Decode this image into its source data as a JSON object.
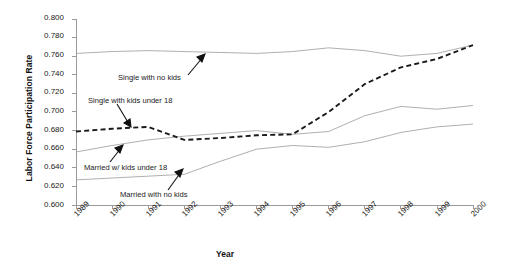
{
  "chart_data": {
    "type": "line",
    "title": "",
    "xlabel": "Year",
    "ylabel": "Labor Force Participation Rate",
    "x": [
      1989,
      1990,
      1991,
      1992,
      1993,
      1994,
      1995,
      1996,
      1997,
      1998,
      1999,
      2000
    ],
    "xticklabels": [
      "1989",
      "1990",
      "1991",
      "1992",
      "1993",
      "1994",
      "1995",
      "1996",
      "1997",
      "1998",
      "1999",
      "2000"
    ],
    "yticklabels": [
      "0.600",
      "0.620",
      "0.640",
      "0.660",
      "0.680",
      "0.700",
      "0.720",
      "0.740",
      "0.760",
      "0.780",
      "0.800"
    ],
    "ylim": [
      0.6,
      0.8
    ],
    "ytick_step": 0.02,
    "grid": false,
    "legend_position": "inline-annotations",
    "series": [
      {
        "name": "Single with no kids",
        "style": "solid",
        "color": "#9a9a9a",
        "values": [
          0.763,
          0.765,
          0.766,
          0.765,
          0.764,
          0.763,
          0.765,
          0.769,
          0.766,
          0.76,
          0.763,
          0.772
        ]
      },
      {
        "name": "Single with kids under 18",
        "style": "dashed",
        "color": "#1a1a1a",
        "values": [
          0.679,
          0.682,
          0.684,
          0.67,
          0.672,
          0.675,
          0.676,
          0.7,
          0.73,
          0.748,
          0.757,
          0.772
        ]
      },
      {
        "name": "Married w/ kids under 18",
        "style": "solid",
        "color": "#9a9a9a",
        "values": [
          0.657,
          0.664,
          0.67,
          0.674,
          0.677,
          0.68,
          0.676,
          0.679,
          0.696,
          0.706,
          0.703,
          0.707
        ]
      },
      {
        "name": "Married with no kids",
        "style": "solid",
        "color": "#9a9a9a",
        "values": [
          0.627,
          0.629,
          0.631,
          0.633,
          0.647,
          0.66,
          0.664,
          0.662,
          0.668,
          0.678,
          0.684,
          0.687
        ]
      }
    ],
    "annotations": [
      {
        "text": "Single with no kids",
        "target_series": "Single with no kids"
      },
      {
        "text": "Single with kids under 18",
        "target_series": "Single with kids under 18"
      },
      {
        "text": "Married w/ kids under 18",
        "target_series": "Married w/ kids under 18"
      },
      {
        "text": "Married with no kids",
        "target_series": "Married with no kids"
      }
    ]
  }
}
